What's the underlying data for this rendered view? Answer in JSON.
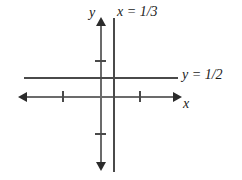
{
  "figure": {
    "kind": "coordinate-plane-graph",
    "background_color": "#ffffff",
    "axis_color": "#6b6b6b",
    "line_color": "#4a4a4a",
    "arrow_color": "#2b2b2b",
    "label_color": "#1a1a1a"
  },
  "labels": {
    "y_axis": "y",
    "x_axis": "x",
    "vertical_line": "x = 1/3",
    "horizontal_line": "y = 1/2"
  },
  "chart_data": {
    "type": "line",
    "title": "",
    "xlabel": "x",
    "ylabel": "y",
    "grid": false,
    "legend": "none",
    "xlim": [
      -2.5,
      2.5
    ],
    "ylim": [
      -2.5,
      2.5
    ],
    "axes": {
      "x_axis": {
        "label": "x",
        "arrows": [
          "left",
          "right"
        ],
        "ticks": [
          -1,
          1
        ]
      },
      "y_axis": {
        "label": "y",
        "arrows": [
          "up",
          "down"
        ],
        "ticks": [
          -1,
          1
        ]
      }
    },
    "series": [
      {
        "name": "x = 1/3",
        "kind": "vertical-line",
        "equation": "x = 1/3",
        "value": 0.3333,
        "arrows": "none"
      },
      {
        "name": "y = 1/2",
        "kind": "horizontal-line",
        "equation": "y = 1/2",
        "value": 0.5,
        "arrows": "none"
      }
    ],
    "annotations": [
      {
        "text": "x = 1/3",
        "position": "top",
        "attached_to": "vertical-line"
      },
      {
        "text": "y = 1/2",
        "position": "right",
        "attached_to": "horizontal-line"
      }
    ]
  }
}
